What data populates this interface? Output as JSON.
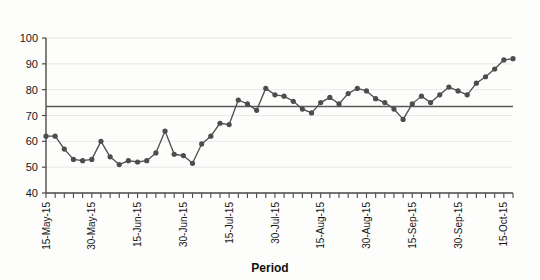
{
  "chart_data": {
    "type": "line",
    "title": "",
    "xlabel": "Period",
    "ylabel": "",
    "ylim": [
      40,
      100
    ],
    "ytick_step": 10,
    "yticks": [
      40,
      50,
      60,
      70,
      80,
      90,
      100
    ],
    "grid": true,
    "legend": false,
    "marker": "filled-circle",
    "line_color": "#4d4d4d",
    "marker_color": "#4d4d4d",
    "reference_line": {
      "label": "",
      "value": 73.5,
      "color": "#595959"
    },
    "x_tick_labels_every": 5,
    "x_tick_labels": [
      "15-May-15",
      "30-May-15",
      "15-Jun-15",
      "30-Jun-15",
      "15-Jul-15",
      "30-Jul-15",
      "15-Aug-15",
      "30-Aug-15",
      "15-Sep-15",
      "30-Sep-15",
      "15-Oct-15",
      "30-Oct-15",
      "15-Nov-15",
      "30-Nov-15",
      "15-Dec-15",
      "30-Dec-15",
      "15-Jan-16",
      "30-Jan-16"
    ],
    "x": [
      1,
      2,
      3,
      4,
      5,
      6,
      7,
      8,
      9,
      10,
      11,
      12,
      13,
      14,
      15,
      16,
      17,
      18,
      19,
      20,
      21,
      22,
      23,
      24,
      25,
      26,
      27,
      28,
      29,
      30,
      31,
      32,
      33,
      34,
      35,
      36,
      37,
      38,
      39,
      40,
      41,
      42,
      43,
      44,
      45,
      46,
      47,
      48,
      49,
      50,
      51,
      52
    ],
    "values": [
      62,
      62,
      57,
      53,
      52.5,
      53,
      60,
      54,
      51,
      52.5,
      52,
      52.5,
      55.5,
      64,
      55,
      54.5,
      51.5,
      59,
      62,
      67,
      66.5,
      76,
      74.5,
      72,
      80.5,
      78,
      77.5,
      75.5,
      72.5,
      71,
      75,
      77,
      74.5,
      78.5,
      80.5,
      79.5,
      76.5,
      75,
      72.5,
      68.5,
      74.5,
      77.5,
      75,
      78,
      81,
      79.5,
      78,
      82.5,
      85,
      88,
      91.5,
      92
    ],
    "axis_color": "#4a4a4a",
    "grid_color": "#e8e8e8"
  },
  "xaxis": {
    "title": "Period"
  }
}
